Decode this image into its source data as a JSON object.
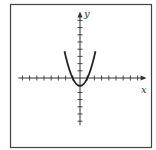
{
  "chart_data": {
    "type": "line",
    "title": "",
    "xlabel": "x",
    "ylabel": "y",
    "function": "y = x^2 - 1 (parabola opening upward, vertex slightly below origin)",
    "x_ticks_left": 8,
    "x_ticks_right": 8,
    "y_ticks_up": 8,
    "y_ticks_down": 6,
    "tick_labels": [],
    "grid": false,
    "legend": null,
    "series": [
      {
        "name": "parabola",
        "x": [
          -2.1,
          -1.5,
          -1,
          -0.5,
          0,
          0.5,
          1,
          1.5,
          2.1
        ],
        "y": [
          3.6,
          1.25,
          0,
          -0.75,
          -1,
          -0.75,
          0,
          1.25,
          3.6
        ]
      }
    ],
    "axis_color": "#333333",
    "curve_color": "#222222"
  },
  "labels": {
    "x_axis": "x",
    "y_axis": "y"
  }
}
